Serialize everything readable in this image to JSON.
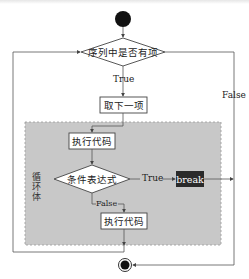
{
  "diagram": {
    "type": "flowchart",
    "nodes": {
      "start": {
        "shape": "circle"
      },
      "condition_loop": {
        "shape": "diamond",
        "label": "序列中是否有项"
      },
      "next_item": {
        "shape": "rect",
        "label": "取下一项"
      },
      "exec_code_1": {
        "shape": "rect",
        "label": "执行代码"
      },
      "condition_expr": {
        "shape": "diamond",
        "label": "条件表达式"
      },
      "break": {
        "shape": "rect-dark",
        "label": "break"
      },
      "exec_code_2": {
        "shape": "rect",
        "label": "执行代码"
      },
      "end": {
        "shape": "circle-end"
      }
    },
    "edges": {
      "loop_true": "True",
      "loop_false": "False",
      "expr_true": "True",
      "expr_false": "False"
    },
    "region_label": "循环体",
    "colors": {
      "region_fill": "#c8c8c8",
      "break_fill": "#2a2a2a",
      "line": "#555555"
    }
  }
}
